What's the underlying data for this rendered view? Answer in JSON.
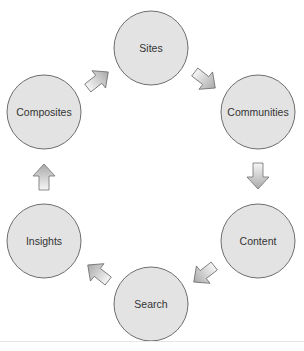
{
  "diagram": {
    "type": "cycle",
    "colors": {
      "node_fill": "#e3e3e3",
      "node_stroke": "#6e6e6e",
      "label": "#333333",
      "arrow_fill_light": "#f6f6f6",
      "arrow_fill_dark": "#a9a9a9",
      "arrow_stroke": "#6e6e6e"
    },
    "nodes": [
      {
        "id": "sites",
        "label": "Sites"
      },
      {
        "id": "communities",
        "label": "Communities"
      },
      {
        "id": "content",
        "label": "Content"
      },
      {
        "id": "search",
        "label": "Search"
      },
      {
        "id": "insights",
        "label": "Insights"
      },
      {
        "id": "composites",
        "label": "Composites"
      }
    ],
    "edges": [
      {
        "from": "sites",
        "to": "communities"
      },
      {
        "from": "communities",
        "to": "content"
      },
      {
        "from": "content",
        "to": "search"
      },
      {
        "from": "search",
        "to": "insights"
      },
      {
        "from": "insights",
        "to": "composites"
      },
      {
        "from": "composites",
        "to": "sites"
      }
    ]
  }
}
